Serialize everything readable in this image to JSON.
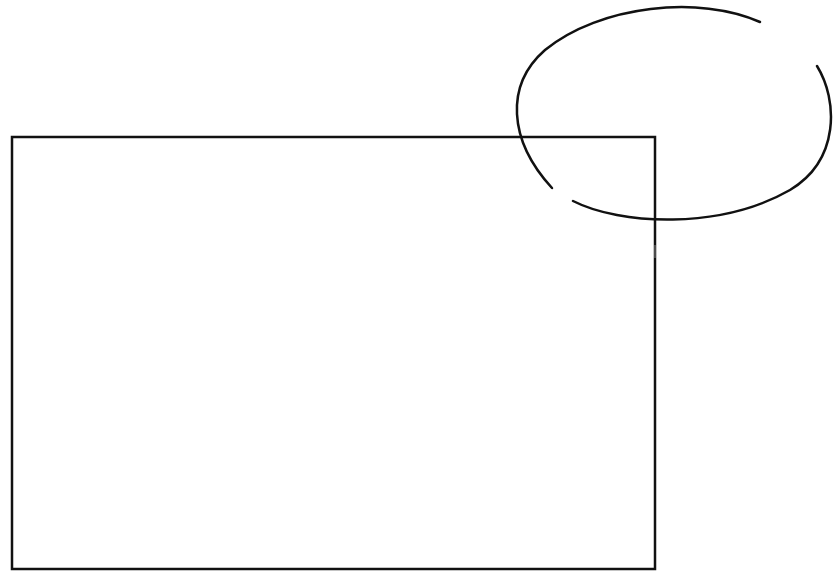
{
  "canvas": {
    "width": 833,
    "height": 577,
    "background": "#ffffff"
  },
  "stroke_color": "#111111",
  "shapes": {
    "rectangle": {
      "x": 12,
      "y": 137,
      "width": 643,
      "height": 432
    },
    "ellipse": {
      "cx": 677,
      "cy": 112,
      "rx": 162,
      "ry": 108
    }
  }
}
